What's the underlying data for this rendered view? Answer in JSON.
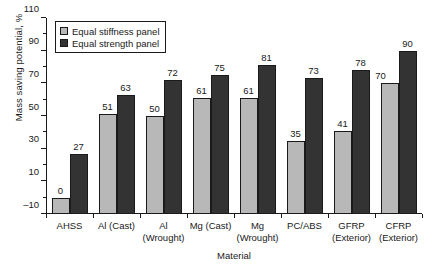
{
  "chart_data": {
    "type": "bar",
    "title": "",
    "xlabel": "Material",
    "ylabel": "Mass saving potential, %",
    "ylim": [
      -10,
      110
    ],
    "yticks": [
      -10,
      10,
      30,
      50,
      70,
      90,
      110
    ],
    "yminor_step": 10,
    "grid": false,
    "legend_position": "upper-left-inside",
    "categories": [
      "AHSS",
      "Al (Cast)",
      "Al\n(Wrought)",
      "Mg (Cast)",
      "Mg\n(Wrought)",
      "PC/ABS",
      "GFRP\n(Exterior)",
      "CFRP\n(Exterior)"
    ],
    "category_lines": [
      [
        "AHSS"
      ],
      [
        "Al (Cast)"
      ],
      [
        "Al",
        "(Wrought)"
      ],
      [
        "Mg (Cast)"
      ],
      [
        "Mg",
        "(Wrought)"
      ],
      [
        "PC/ABS"
      ],
      [
        "GFRP",
        "(Exterior)"
      ],
      [
        "CFRP",
        "(Exterior)"
      ]
    ],
    "series": [
      {
        "name": "Equal stiffness panel",
        "color": "#b8b8b8",
        "values": [
          0,
          51,
          50,
          61,
          61,
          35,
          41,
          70
        ]
      },
      {
        "name": "Equal strength panel",
        "color": "#333333",
        "values": [
          27,
          63,
          72,
          75,
          81,
          73,
          78,
          90
        ]
      }
    ]
  },
  "legend": {
    "items": [
      {
        "label": "Equal stiffness panel",
        "swatch": "stiff"
      },
      {
        "label": "Equal strength panel",
        "swatch": "strength"
      }
    ]
  },
  "colors": {
    "stiffness": "#b8b8b8",
    "strength": "#333333",
    "axis": "#1a1a1a",
    "background": "#ffffff"
  }
}
